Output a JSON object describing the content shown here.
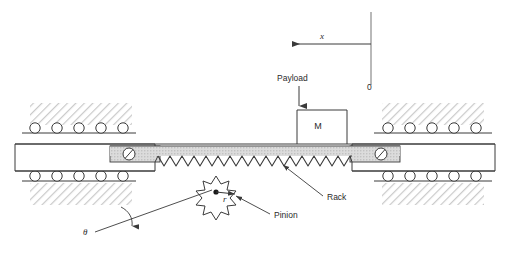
{
  "diagram": {
    "labels": {
      "x_axis": "x",
      "origin": "0",
      "payload": "Payload",
      "mass": "M",
      "rack": "Rack",
      "pinion": "Pinion",
      "theta": "θ",
      "radius": "r"
    },
    "colors": {
      "line": "#3a3a3a",
      "hatch": "#c9c9c9",
      "rack_fill": "#d9d9d9",
      "background": "#ffffff",
      "text": "#2b2b2b"
    },
    "geometry": {
      "carriage_left": 15,
      "carriage_right": 495,
      "carriage_top": 143,
      "carriage_bottom": 172,
      "rack_teeth_count": 20,
      "roller_count_per_row": 5,
      "pinion_points": 9
    }
  }
}
